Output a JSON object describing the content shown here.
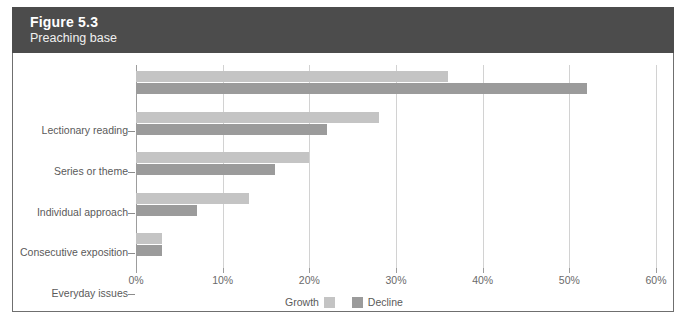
{
  "figure": {
    "number": "Figure 5.3",
    "subtitle": "Preaching base",
    "header_bg": "#4c4c4c",
    "header_text_color": "#ffffff"
  },
  "legend": {
    "growth_label": "Growth",
    "decline_label": "Decline",
    "growth_color": "#c4c4c4",
    "decline_color": "#9b9b9b",
    "position": "bottom-center"
  },
  "axis": {
    "x_ticks": [
      "0%",
      "10%",
      "20%",
      "30%",
      "40%",
      "50%",
      "60%"
    ],
    "x_tick_values": [
      0,
      10,
      20,
      30,
      40,
      50,
      60
    ]
  },
  "chart_data": {
    "type": "bar",
    "orientation": "horizontal",
    "title": "Figure 5.3",
    "subtitle": "Preaching base",
    "xlabel": "",
    "ylabel": "",
    "xlim": [
      0,
      60
    ],
    "grid": true,
    "grid_axis": "x",
    "tick_suffix": "%",
    "categories": [
      "Lectionary reading",
      "Series or theme",
      "Individual approach",
      "Consecutive exposition",
      "Everyday issues"
    ],
    "series": [
      {
        "name": "Growth",
        "color": "#c4c4c4",
        "values": [
          36,
          28,
          20,
          13,
          3
        ]
      },
      {
        "name": "Decline",
        "color": "#9b9b9b",
        "values": [
          52,
          22,
          16,
          7,
          3
        ]
      }
    ],
    "legend_position": "bottom-center",
    "axis_ticks": [
      0,
      10,
      20,
      30,
      40,
      50,
      60
    ],
    "tick_labels": [
      "0%",
      "10%",
      "20%",
      "30%",
      "40%",
      "50%",
      "60%"
    ]
  }
}
